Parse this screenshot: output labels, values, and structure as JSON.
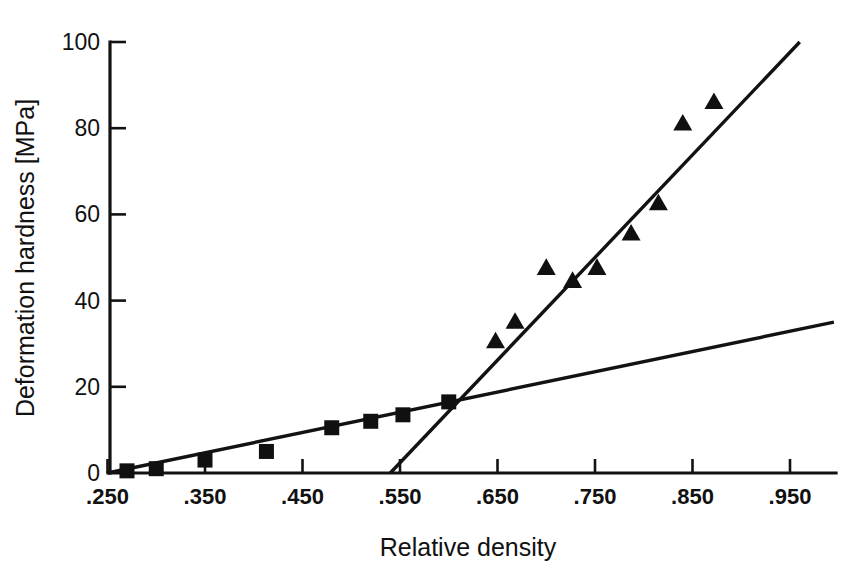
{
  "chart_data": {
    "type": "scatter",
    "title": "",
    "subtitle": "",
    "xlabel": "Relative density",
    "ylabel": "Deformation hardness [MPa]",
    "xlim": [
      0.25,
      1.0
    ],
    "ylim": [
      0,
      100
    ],
    "grid": false,
    "legend_position": "none",
    "x_ticks": [
      0.25,
      0.35,
      0.45,
      0.55,
      0.65,
      0.75,
      0.85,
      0.95
    ],
    "x_tick_labels": [
      ".250",
      ".350",
      ".450",
      ".550",
      ".650",
      ".750",
      ".850",
      ".950"
    ],
    "y_ticks": [
      0,
      20,
      40,
      60,
      80,
      100
    ],
    "y_tick_labels": [
      "0",
      "20",
      "40",
      "60",
      "80",
      "100"
    ],
    "series": [
      {
        "name": "low-density series",
        "marker": "filled-square",
        "color": "#101010",
        "points": [
          {
            "x": 0.27,
            "y": 0.5
          },
          {
            "x": 0.3,
            "y": 1.0
          },
          {
            "x": 0.35,
            "y": 3.0
          },
          {
            "x": 0.413,
            "y": 5.0
          },
          {
            "x": 0.48,
            "y": 10.5
          },
          {
            "x": 0.52,
            "y": 12.0
          },
          {
            "x": 0.553,
            "y": 13.5
          },
          {
            "x": 0.6,
            "y": 16.5
          }
        ]
      },
      {
        "name": "high-density series",
        "marker": "filled-triangle",
        "color": "#101010",
        "points": [
          {
            "x": 0.648,
            "y": 30.5
          },
          {
            "x": 0.668,
            "y": 35.0
          },
          {
            "x": 0.7,
            "y": 47.5
          },
          {
            "x": 0.727,
            "y": 44.5
          },
          {
            "x": 0.752,
            "y": 47.5
          },
          {
            "x": 0.787,
            "y": 55.5
          },
          {
            "x": 0.815,
            "y": 62.5
          },
          {
            "x": 0.84,
            "y": 81.0
          },
          {
            "x": 0.872,
            "y": 86.0
          }
        ]
      }
    ],
    "fit_lines": [
      {
        "name": "shallow-fit-line",
        "x1": 0.25,
        "y1": 0.0,
        "x2": 0.995,
        "y2": 35.0,
        "color": "#121212"
      },
      {
        "name": "steep-fit-line",
        "x1": 0.54,
        "y1": 0.0,
        "x2": 0.96,
        "y2": 100.0,
        "color": "#121212"
      }
    ]
  }
}
